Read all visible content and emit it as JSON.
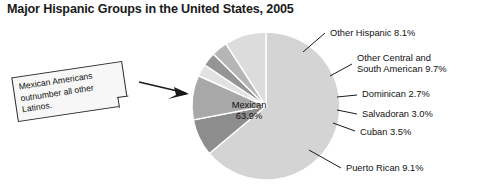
{
  "chart_data": {
    "type": "pie",
    "title": "Major Hispanic Groups in the United States, 2005",
    "xlabel": "",
    "ylabel": "",
    "legend_position": "callouts",
    "grid": false,
    "units": "percent",
    "categories": [
      "Mexican",
      "Other Hispanic",
      "Other Central and South American",
      "Dominican",
      "Salvadoran",
      "Cuban",
      "Puerto Rican"
    ],
    "values": [
      63.9,
      8.1,
      9.7,
      2.7,
      3.0,
      3.5,
      9.1
    ],
    "slices": [
      {
        "name": "Mexican",
        "value": 63.9,
        "label": "Mexican",
        "value_label": "63.9%",
        "color": "#d4d4d4",
        "placement": "inside"
      },
      {
        "name": "Other Hispanic",
        "value": 8.1,
        "label": "Other Hispanic 8.1%",
        "color": "#8d8d8d",
        "placement": "outside"
      },
      {
        "name": "Other Central and South American",
        "value": 9.7,
        "label_line1": "Other Central and",
        "label_line2": "South American 9.7%",
        "color": "#a8a8a8",
        "placement": "outside"
      },
      {
        "name": "Dominican",
        "value": 2.7,
        "label": "Dominican 2.7%",
        "color": "#e2e2e2",
        "placement": "outside"
      },
      {
        "name": "Salvadoran",
        "value": 3.0,
        "label": "Salvadoran 3.0%",
        "color": "#959595",
        "placement": "outside"
      },
      {
        "name": "Cuban",
        "value": 3.5,
        "label": "Cuban 3.5%",
        "color": "#b5b5b5",
        "placement": "outside"
      },
      {
        "name": "Puerto Rican",
        "value": 9.1,
        "label": "Puerto Rican 9.1%",
        "color": "#dcdcdc",
        "placement": "outside"
      }
    ]
  },
  "title": "Major Hispanic Groups in the United States, 2005",
  "callout": {
    "text": "Mexican Americans outnumber all other Latinos."
  },
  "labels": {
    "mexican_name": "Mexican",
    "mexican_value": "63.9%",
    "other_hispanic": "Other Hispanic 8.1%",
    "other_central_line1": "Other Central and",
    "other_central_line2": "South American 9.7%",
    "dominican": "Dominican 2.7%",
    "salvadoran": "Salvadoran 3.0%",
    "cuban": "Cuban 3.5%",
    "puerto_rican": "Puerto Rican 9.1%"
  }
}
